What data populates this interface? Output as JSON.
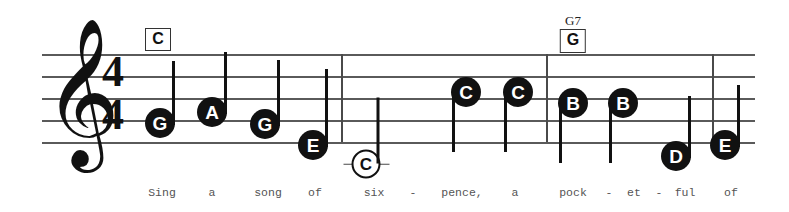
{
  "score": {
    "title": "Sing a Song of Sixpence",
    "clef": "treble-clef",
    "time_signature": {
      "beats": "4",
      "beat_type": "4"
    },
    "staff": {
      "left": 42,
      "right": 755,
      "top_line_y": 54,
      "line_spacing": 22,
      "line_count": 5
    },
    "barlines": [
      {
        "name": "barline-1",
        "x": 341
      },
      {
        "name": "barline-2",
        "x": 546
      },
      {
        "name": "barline-end",
        "x": 712
      }
    ],
    "chords": [
      {
        "name": "C",
        "symbol": "C",
        "box_letter": "C",
        "x": 158,
        "y": 28,
        "show_name": false
      },
      {
        "name": "G7",
        "symbol": "G7",
        "box_letter": "G",
        "x": 573,
        "y": 14,
        "show_name": true
      }
    ],
    "notes": [
      {
        "id": "n1",
        "letter": "G",
        "x": 160,
        "y": 123,
        "stem": "up",
        "stem_len": 64,
        "hollow": false,
        "ledger": false
      },
      {
        "id": "n2",
        "letter": "A",
        "x": 212,
        "y": 112,
        "stem": "up",
        "stem_len": 62,
        "hollow": false,
        "ledger": false
      },
      {
        "id": "n3",
        "letter": "G",
        "x": 265,
        "y": 124,
        "stem": "up",
        "stem_len": 66,
        "hollow": false,
        "ledger": false
      },
      {
        "id": "n4",
        "letter": "E",
        "x": 313,
        "y": 145,
        "stem": "up",
        "stem_len": 78,
        "hollow": false,
        "ledger": false
      },
      {
        "id": "n5",
        "letter": "C",
        "x": 366,
        "y": 164,
        "stem": "up",
        "stem_len": 66,
        "hollow": true,
        "ledger": true
      },
      {
        "id": "n6",
        "letter": "C",
        "x": 466,
        "y": 92,
        "stem": "down",
        "stem_len": 62,
        "hollow": false,
        "ledger": false
      },
      {
        "id": "n7",
        "letter": "C",
        "x": 518,
        "y": 92,
        "stem": "down",
        "stem_len": 62,
        "hollow": false,
        "ledger": false
      },
      {
        "id": "n8",
        "letter": "B",
        "x": 573,
        "y": 103,
        "stem": "down",
        "stem_len": 62,
        "hollow": false,
        "ledger": false
      },
      {
        "id": "n9",
        "letter": "B",
        "x": 623,
        "y": 103,
        "stem": "down",
        "stem_len": 62,
        "hollow": false,
        "ledger": false
      },
      {
        "id": "n10",
        "letter": "D",
        "x": 676,
        "y": 156,
        "stem": "up",
        "stem_len": 62,
        "hollow": false,
        "ledger": false
      },
      {
        "id": "n11",
        "letter": "E",
        "x": 725,
        "y": 145,
        "stem": "up",
        "stem_len": 62,
        "hollow": false,
        "ledger": false
      }
    ],
    "lyrics": [
      {
        "text": "Sing",
        "x": 162
      },
      {
        "text": "a",
        "x": 212
      },
      {
        "text": "song",
        "x": 268
      },
      {
        "text": "of",
        "x": 315
      },
      {
        "text": "six",
        "x": 374
      },
      {
        "text": "-",
        "x": 413
      },
      {
        "text": "pence,",
        "x": 462
      },
      {
        "text": "a",
        "x": 515
      },
      {
        "text": "pock",
        "x": 573
      },
      {
        "text": "-",
        "x": 609
      },
      {
        "text": "et",
        "x": 634
      },
      {
        "text": "-",
        "x": 659
      },
      {
        "text": "ful",
        "x": 685
      },
      {
        "text": "of",
        "x": 731
      }
    ]
  }
}
